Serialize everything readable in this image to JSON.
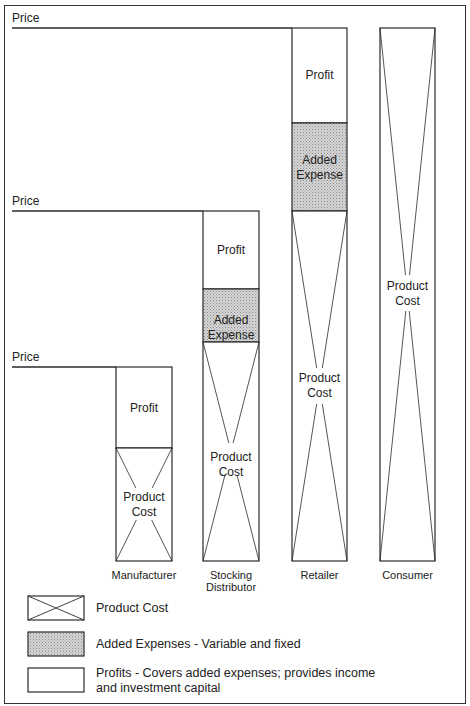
{
  "title": "",
  "price_label": "Price",
  "stages": [
    {
      "name": "Manufacturer",
      "name_lines": [
        "Manufacturer"
      ],
      "segments": [
        "Profit",
        "Product Cost"
      ]
    },
    {
      "name": "Stocking Distributor",
      "name_lines": [
        "Stocking",
        "Distributor"
      ],
      "segments": [
        "Profit",
        "Added Expense",
        "Product Cost"
      ]
    },
    {
      "name": "Retailer",
      "name_lines": [
        "Retailer"
      ],
      "segments": [
        "Profit",
        "Added Expense",
        "Product Cost"
      ]
    },
    {
      "name": "Consumer",
      "name_lines": [
        "Consumer"
      ],
      "segments": [
        "Product Cost"
      ]
    }
  ],
  "segment_labels": {
    "profit": "Profit",
    "added_expense": [
      "Added",
      "Expense"
    ],
    "product_cost": [
      "Product",
      "Cost"
    ]
  },
  "legend": [
    {
      "key": "product-cost",
      "label": "Product Cost"
    },
    {
      "key": "added-expenses",
      "label": "Added Expenses - Variable and fixed"
    },
    {
      "key": "profits",
      "label": "Profits - Covers added expenses; provides income and investment capital"
    }
  ],
  "colors": {
    "line": "#2a2a2a",
    "expense_fill": "#c8c8c8",
    "background": "#ffffff"
  }
}
